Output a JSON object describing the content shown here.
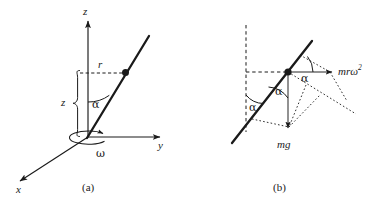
{
  "figure": {
    "background_color": "#ffffff",
    "stroke_color": "#1a1a1a",
    "panels": [
      {
        "id": "a",
        "caption": "(a)",
        "description": "Three-dimensional axes with an inclined rod rotating about the z axis",
        "labels": {
          "z_axis": "z",
          "y_axis": "y",
          "x_axis": "x",
          "radius": "r",
          "height": "z",
          "angle": "α",
          "angular_velocity": "ω"
        }
      },
      {
        "id": "b",
        "caption": "(b)",
        "description": "Force diagram on the bead showing weight and centrifugal force resolved along the rod",
        "labels": {
          "weight": "mg",
          "centrifugal_base": "mrω",
          "centrifugal_exponent": "2",
          "angle_top": "α",
          "angle_middle": "α",
          "angle_left": "α"
        }
      }
    ]
  }
}
